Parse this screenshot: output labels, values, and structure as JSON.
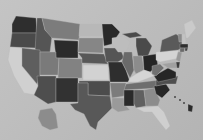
{
  "map": {
    "type": "choropleth",
    "region": "United States",
    "palette": "grayscale",
    "background": "#bdbdbd",
    "states": [
      {
        "id": "WA",
        "fill": "#2e2e2e",
        "points": "16,16 36,18 37,33 12,33 12,24"
      },
      {
        "id": "OR",
        "fill": "#4a4a4a",
        "points": "12,33 37,33 36,48 10,47"
      },
      {
        "id": "CA",
        "fill": "#d0d0d0",
        "points": "10,47 22,48 22,66 40,88 36,95 24,93 14,76 8,60"
      },
      {
        "id": "ID",
        "fill": "#555555",
        "points": "37,18 42,18 45,30 52,36 50,52 35,52 36,33"
      },
      {
        "id": "NV",
        "fill": "#5e5e5e",
        "points": "22,48 40,50 40,76 37,84 22,66"
      },
      {
        "id": "MT",
        "fill": "#7c7c7c",
        "points": "42,18 80,24 79,40 52,38 45,30"
      },
      {
        "id": "WY",
        "fill": "#2b2b2b",
        "points": "54,40 78,41 78,58 56,58"
      },
      {
        "id": "UT",
        "fill": "#7a7a7a",
        "points": "40,52 56,52 56,58 59,58 58,75 40,75"
      },
      {
        "id": "CO",
        "fill": "#828282",
        "points": "59,58 82,59 82,78 58,78"
      },
      {
        "id": "AZ",
        "fill": "#4e4e4e",
        "points": "37,76 56,76 56,102 48,104 34,95 38,86"
      },
      {
        "id": "NM",
        "fill": "#323232",
        "points": "56,78 78,78 78,102 56,102"
      },
      {
        "id": "ND",
        "fill": "#b8b8b8",
        "points": "80,24 102,24 102,36 79,36"
      },
      {
        "id": "SD",
        "fill": "#868686",
        "points": "79,38 103,38 103,53 78,52"
      },
      {
        "id": "NE",
        "fill": "#585858",
        "points": "78,53 104,54 108,64 82,63 82,58"
      },
      {
        "id": "KS",
        "fill": "#d2d2d2",
        "points": "83,65 108,65 109,80 83,80"
      },
      {
        "id": "OK",
        "fill": "#4c4c4c",
        "points": "79,81 110,81 110,96 88,95 88,83 79,83"
      },
      {
        "id": "TX",
        "fill": "#585858",
        "points": "78,83 88,83 88,95 110,96 112,108 106,114 98,122 96,130 90,126 84,114 75,110 70,104 78,103"
      },
      {
        "id": "MN",
        "fill": "#292929",
        "points": "102,24 112,24 120,32 112,44 104,46 103,36"
      },
      {
        "id": "IA",
        "fill": "#555555",
        "points": "104,48 120,48 124,58 118,62 106,62"
      },
      {
        "id": "MO",
        "fill": "#2e2e2e",
        "points": "108,62 122,62 126,70 130,82 110,82 109,68"
      },
      {
        "id": "AR",
        "fill": "#7c7c7c",
        "points": "110,83 126,83 124,96 112,98"
      },
      {
        "id": "LA",
        "fill": "#9a9a9a",
        "points": "112,98 124,98 126,106 130,110 118,112 112,108"
      },
      {
        "id": "WI",
        "fill": "#bdbdbd",
        "points": "112,38 124,36 130,42 126,52 118,52 112,44"
      },
      {
        "id": "IL",
        "fill": "#6a6a6a",
        "points": "124,52 132,52 134,70 130,78 126,70 122,62"
      },
      {
        "id": "MI",
        "fill": "#4a4a4a",
        "points": "136,38 146,38 152,46 148,56 138,56 136,46"
      },
      {
        "id": "MI-UP",
        "fill": "#4a4a4a",
        "points": "122,34 136,32 142,36 130,38"
      },
      {
        "id": "IN",
        "fill": "#8c8c8c",
        "points": "133,56 142,56 144,70 136,74 134,70"
      },
      {
        "id": "OH",
        "fill": "#242424",
        "points": "143,56 156,54 158,66 150,72 144,70"
      },
      {
        "id": "KY",
        "fill": "#d5d5d5",
        "points": "130,78 136,74 144,70 150,72 154,76 138,82 128,82"
      },
      {
        "id": "TN",
        "fill": "#6e6e6e",
        "points": "126,84 160,80 158,88 124,90"
      },
      {
        "id": "MS",
        "fill": "#2a2a2a",
        "points": "124,90 134,90 134,106 130,106 124,106"
      },
      {
        "id": "AL",
        "fill": "#606060",
        "points": "134,90 144,90 146,106 136,108 134,104"
      },
      {
        "id": "GA",
        "fill": "#8c8c8c",
        "points": "144,90 154,88 160,100 158,106 146,106"
      },
      {
        "id": "FL",
        "fill": "#cfcfcf",
        "points": "136,108 158,106 164,112 170,126 166,130 158,120 152,112 144,112"
      },
      {
        "id": "SC",
        "fill": "#262626",
        "points": "154,86 166,84 170,90 162,98 156,94"
      },
      {
        "id": "NC",
        "fill": "#4e4e4e",
        "points": "156,80 178,76 176,84 166,84 156,86"
      },
      {
        "id": "VA",
        "fill": "#262626",
        "points": "154,76 168,68 176,72 176,78 158,82"
      },
      {
        "id": "WV",
        "fill": "#707070",
        "points": "152,66 160,64 164,68 156,76 152,74"
      },
      {
        "id": "PA",
        "fill": "#d4d4d4",
        "points": "156,52 178,50 180,58 160,62 156,60"
      },
      {
        "id": "NY",
        "fill": "#5a5a5a",
        "points": "162,40 176,34 182,38 182,48 178,50 160,52"
      },
      {
        "id": "NJ",
        "fill": "#9a9a9a",
        "points": "178,52 182,52 180,62 176,60"
      },
      {
        "id": "MD",
        "fill": "#a0a0a0",
        "points": "162,64 176,62 178,68 168,68"
      },
      {
        "id": "DE",
        "fill": "#3a3a3a",
        "points": "176,62 180,62 179,68 177,68"
      },
      {
        "id": "VT",
        "fill": "#8a8a8a",
        "points": "178,34 182,34 182,42 179,42"
      },
      {
        "id": "NH",
        "fill": "#c2c2c2",
        "points": "182,34 185,34 186,44 182,44"
      },
      {
        "id": "ME",
        "fill": "#cacaca",
        "points": "184,24 192,20 196,28 188,38 186,38"
      },
      {
        "id": "MA",
        "fill": "#2e2e2e",
        "points": "180,44 188,44 188,48 180,48"
      },
      {
        "id": "CT",
        "fill": "#6a6a6a",
        "points": "180,48 185,48 184,52 180,52"
      },
      {
        "id": "RI",
        "fill": "#454545",
        "points": "185,48 188,48 187,51 185,51"
      },
      {
        "id": "AK",
        "fill": "#8c8c8c",
        "points": "40,110 52,108 56,114 58,128 50,130 42,126 38,118"
      },
      {
        "id": "HI-1",
        "fill": "#3a3a3a",
        "points": "174,96 176,96 176,98 174,98"
      },
      {
        "id": "HI-2",
        "fill": "#3a3a3a",
        "points": "179,99 181,99 181,101 179,101"
      },
      {
        "id": "HI-3",
        "fill": "#3a3a3a",
        "points": "183,102 185,102 185,104 183,104"
      },
      {
        "id": "HI-4",
        "fill": "#2a2a2a",
        "points": "188,104 193,106 192,112 188,111"
      }
    ]
  }
}
